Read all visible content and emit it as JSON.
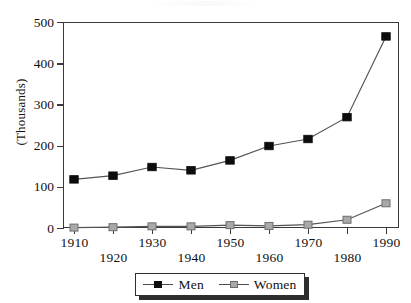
{
  "chart_data": {
    "type": "line",
    "title": "",
    "xlabel": "",
    "ylabel": "(Thousands)",
    "x": [
      1910,
      1920,
      1930,
      1940,
      1950,
      1960,
      1970,
      1980,
      1990
    ],
    "categories": [
      "1910",
      "1920",
      "1930",
      "1940",
      "1950",
      "1960",
      "1970",
      "1980",
      "1990"
    ],
    "series": [
      {
        "name": "Men",
        "color": "#0d0d0d",
        "marker": "filled-square",
        "values": [
          118,
          127,
          148,
          140,
          164,
          199,
          216,
          269,
          465
        ]
      },
      {
        "name": "Women",
        "color": "#a9a9a9",
        "marker": "gray-square",
        "values": [
          1,
          2,
          4,
          4,
          7,
          5,
          8,
          20,
          60
        ]
      }
    ],
    "ylim": [
      0,
      500
    ],
    "xlim": [
      1910,
      1990
    ],
    "yticks": [
      0,
      100,
      200,
      300,
      400,
      500
    ],
    "ytick_labels": [
      "0",
      "100",
      "200",
      "300",
      "400",
      "500"
    ],
    "xticks": [
      1910,
      1920,
      1930,
      1940,
      1950,
      1960,
      1970,
      1980,
      1990
    ],
    "xtick_labels": [
      "1910",
      "1920",
      "1930",
      "1940",
      "1950",
      "1960",
      "1970",
      "1980",
      "1990"
    ],
    "xtick_label_rows": [
      0,
      1,
      0,
      1,
      0,
      1,
      0,
      1,
      0
    ],
    "grid": true,
    "grid_axis": "y",
    "legend_position": "bottom-center"
  },
  "axis": {
    "y_title": "(Thousands)"
  },
  "legend": {
    "entries": [
      {
        "label": "Men"
      },
      {
        "label": "Women"
      }
    ]
  }
}
